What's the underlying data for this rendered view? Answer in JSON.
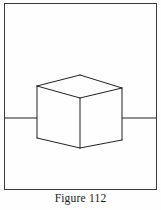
{
  "figure": {
    "caption": "Figure 112",
    "colors": {
      "background": "#fefefe",
      "stroke": "#222222",
      "frame_stroke": "#3a3a3a",
      "caption_text": "#1a1a1a"
    },
    "frame": {
      "name": "outer-rectangle-border",
      "x": 4.5,
      "y": 3.5,
      "width": 152,
      "height": 186,
      "stroke_width": 1.0
    },
    "horizontal_line": {
      "name": "horizontal-reference-line",
      "y": 118,
      "left_x": 4.5,
      "right_x": 156.5,
      "stroke_width": 1.1,
      "description": "straight line crossing behind the cube, hidden where the cube occludes it"
    },
    "cube": {
      "name": "isometric-cube",
      "stroke_width": 1.0,
      "vertices": {
        "top_back": [
          80,
          75
        ],
        "top_left": [
          37,
          86
        ],
        "top_right": [
          122,
          88
        ],
        "top_front": [
          80,
          98
        ],
        "bottom_left": [
          37,
          138
        ],
        "bottom_right": [
          122,
          140
        ],
        "bottom_front": [
          80,
          148
        ]
      },
      "edges": [
        [
          "top_back",
          "top_left"
        ],
        [
          "top_back",
          "top_right"
        ],
        [
          "top_left",
          "top_front"
        ],
        [
          "top_right",
          "top_front"
        ],
        [
          "top_left",
          "bottom_left"
        ],
        [
          "top_right",
          "bottom_right"
        ],
        [
          "top_front",
          "bottom_front"
        ],
        [
          "bottom_left",
          "bottom_front"
        ],
        [
          "bottom_right",
          "bottom_front"
        ]
      ],
      "occlusion_segments": [
        {
          "name": "line-hidden-left",
          "x1": 37,
          "x2": 37
        },
        {
          "name": "line-hidden-right",
          "x1": 122,
          "x2": 122
        }
      ]
    }
  }
}
